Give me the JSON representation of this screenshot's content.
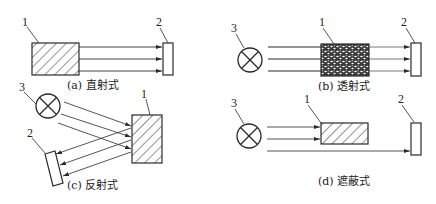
{
  "figure": {
    "panels": [
      {
        "id": "a",
        "caption": "(a)  直射式",
        "labels": {
          "source_object": "1",
          "detector": "2"
        }
      },
      {
        "id": "b",
        "caption": "(b)  透射式",
        "labels": {
          "lamp": "3",
          "medium": "1",
          "detector": "2"
        }
      },
      {
        "id": "c",
        "caption": "(c)  反射式",
        "labels": {
          "lamp": "3",
          "reflector": "1",
          "detector": "2"
        }
      },
      {
        "id": "d",
        "caption": "(d)  遮蔽式",
        "labels": {
          "lamp": "3",
          "obstacle": "1",
          "detector": "2"
        }
      }
    ]
  },
  "colors": {
    "line": "#2a2a2a",
    "background": "#ffffff"
  }
}
